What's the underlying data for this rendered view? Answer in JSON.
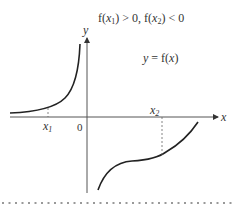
{
  "diagram": {
    "caption": "f(x₁) > 0, f(x₂) < 0",
    "caption_parts": {
      "f1": "f(",
      "x1": "x",
      "x1_sub": "1",
      "close1": ") > 0, f(",
      "x2": "x",
      "x2_sub": "2",
      "close2": ") < 0"
    },
    "function_label": "y = f(x)",
    "function_label_parts": {
      "lhs": "y",
      "eq": " = f(",
      "x": "x",
      "rp": ")"
    },
    "axes": {
      "x_label": "x",
      "y_label": "y",
      "origin_label": "0"
    },
    "points": [
      {
        "name": "x",
        "sub": "1",
        "position": "left of origin, f > 0"
      },
      {
        "name": "x",
        "sub": "2",
        "position": "right of origin, f < 0"
      }
    ],
    "curves": [
      {
        "id": "left-branch",
        "description": "increasing, approaches x-axis as x → -∞, rises steeply near y-axis"
      },
      {
        "id": "right-branch",
        "description": "increasing S-shaped curve below x-axis, crosses axis after x₂"
      }
    ],
    "colors": {
      "axis": "#555555",
      "curve": "#222222",
      "dashed": "#666666",
      "separator": "#999999"
    }
  }
}
